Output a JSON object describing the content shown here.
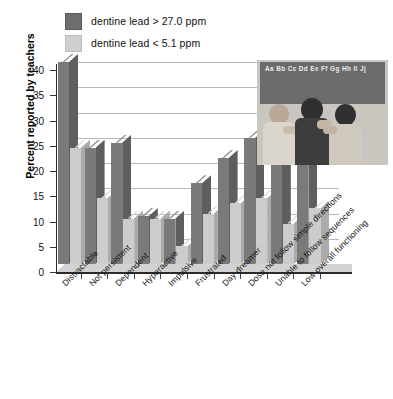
{
  "legend": {
    "items": [
      {
        "label": "dentine lead > 27.0 ppm",
        "color": "#6e6e6e",
        "key": "high"
      },
      {
        "label": "dentine lead < 5.1 ppm",
        "color": "#cfcfcf",
        "key": "low"
      }
    ]
  },
  "inset": {
    "name": "classroom-photo",
    "chalkboard_text": "Aa Bb Cc Dd Ee Ff Gg Hh Ii Jj"
  },
  "chart_data": {
    "type": "bar",
    "title": "",
    "xlabel": "",
    "ylabel": "Percent reported by teachers",
    "ylim": [
      0,
      40
    ],
    "yticks": [
      0,
      5,
      10,
      15,
      20,
      25,
      30,
      35,
      40
    ],
    "grid": true,
    "legend_position": "top-left",
    "categories": [
      "Distractable",
      "Not persistent",
      "Dependent",
      "Hyperactive",
      "Impulsive",
      "Frustrated",
      "Day dreamer",
      "Dose not follow simple directions",
      "Unable to follow sequences",
      "Low overall functioning"
    ],
    "series": [
      {
        "name": "dentine lead > 27.0 ppm",
        "color": "#7a7a7a",
        "values": [
          40,
          23,
          24,
          9.5,
          9,
          16,
          21,
          25,
          29,
          24
        ]
      },
      {
        "name": "dentine lead < 5.1 ppm",
        "color": "#cccccc",
        "values": [
          23,
          13,
          9,
          9,
          3.5,
          10,
          12,
          13,
          8,
          11
        ]
      }
    ]
  }
}
